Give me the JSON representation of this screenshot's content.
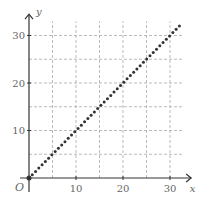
{
  "chart_data": {
    "type": "scatter",
    "title": "",
    "xlabel": "x",
    "ylabel": "y",
    "origin_label": "O",
    "xlim": [
      0,
      33
    ],
    "ylim": [
      0,
      33
    ],
    "grid": true,
    "grid_step": 5,
    "x_ticks": [
      10,
      20,
      30
    ],
    "y_ticks": [
      10,
      20,
      30
    ],
    "x_tick_labels": [
      "10",
      "20",
      "30"
    ],
    "y_tick_labels": [
      "10",
      "20",
      "30"
    ],
    "series": [
      {
        "name": "y = x",
        "style": "dotted",
        "x": [
          0,
          32
        ],
        "y": [
          0,
          32
        ]
      }
    ]
  },
  "colors": {
    "axis": "#333333",
    "grid": "#aaaaaa",
    "series": "#333333",
    "text": "#666666"
  }
}
